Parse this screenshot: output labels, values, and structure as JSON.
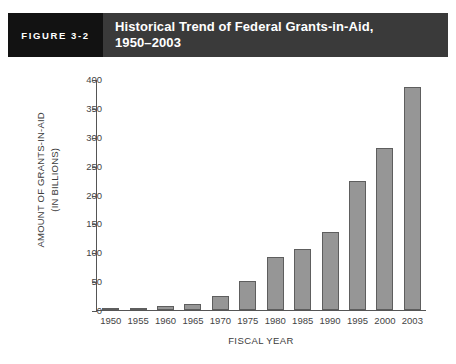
{
  "header": {
    "figure_number": "FIGURE 3-2",
    "title_line1": "Historical Trend of Federal Grants-in-Aid,",
    "title_line2": "1950–2003",
    "number_box_color": "#121212",
    "title_box_color": "#3a3a3a",
    "text_color": "#ffffff"
  },
  "chart_data": {
    "type": "bar",
    "title": "Historical Trend of Federal Grants-in-Aid, 1950–2003",
    "categories": [
      "1950",
      "1955",
      "1960",
      "1965",
      "1970",
      "1975",
      "1980",
      "1985",
      "1990",
      "1995",
      "2000",
      "2003"
    ],
    "values": [
      2,
      3,
      7,
      11,
      24,
      50,
      92,
      106,
      135,
      225,
      281,
      387
    ],
    "xlabel": "FISCAL YEAR",
    "ylabel": "AMOUNT OF GRANTS-IN-AID (IN BILLIONS)",
    "ylabel_line1": "AMOUNT OF GRANTS-IN-AID",
    "ylabel_line2": "(IN BILLIONS)",
    "ylim": [
      0,
      400
    ],
    "yticks": [
      0,
      50,
      100,
      150,
      200,
      250,
      300,
      350,
      400
    ],
    "ytick_labels": [
      "0",
      "50",
      "100",
      "150",
      "200",
      "250",
      "300",
      "350",
      "400"
    ],
    "grid": false,
    "legend": false,
    "bar_color": "#969696",
    "bar_edge_color": "#5e5e5e",
    "axis_color": "#555555"
  }
}
